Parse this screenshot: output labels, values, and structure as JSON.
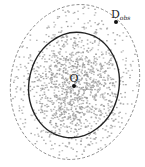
{
  "diagram": {
    "type": "scatter-with-ellipses",
    "labels": {
      "center": "O",
      "observed_main": "D",
      "observed_sub": "obs"
    },
    "colors": {
      "background": "#ffffff",
      "scatter": "#9a9a9a",
      "inner_ellipse": "#222222",
      "outer_ellipse": "#8a8a8a",
      "points": "#111111"
    },
    "inner_ellipse": {
      "cx": 74,
      "cy": 85,
      "rx": 45,
      "ry": 53,
      "rotate": 12,
      "style": "solid"
    },
    "outer_ellipse": {
      "cx": 75,
      "cy": 82,
      "rx": 64,
      "ry": 78,
      "rotate": 12,
      "style": "dashed"
    },
    "center_point": {
      "x": 74,
      "y": 86
    },
    "observed_point": {
      "x": 116,
      "y": 22
    }
  }
}
